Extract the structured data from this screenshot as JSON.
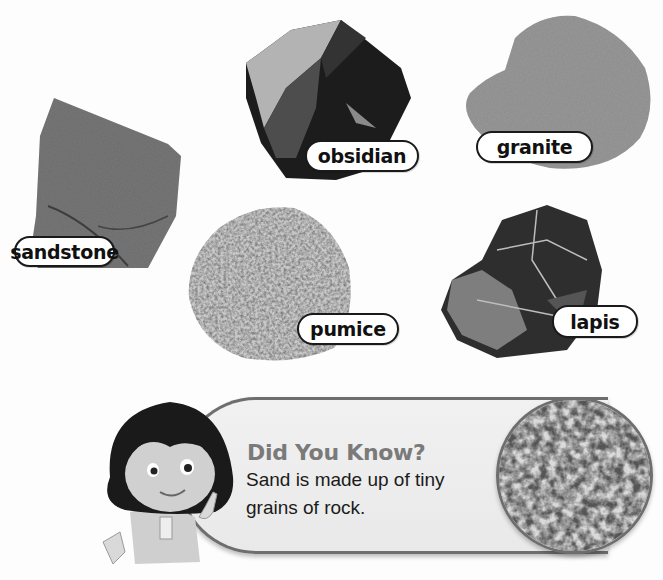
{
  "rocks": [
    {
      "id": "sandstone",
      "label": "sandstone"
    },
    {
      "id": "obsidian",
      "label": "obsidian"
    },
    {
      "id": "granite",
      "label": "granite"
    },
    {
      "id": "pumice",
      "label": "pumice"
    },
    {
      "id": "lapis",
      "label": "lapis"
    }
  ],
  "did_you_know": {
    "title": "Did You Know?",
    "text": "Sand is made up of tiny grains of rock.",
    "image": "sand-grains-closeup",
    "character": "girl-pointing-finger"
  },
  "colors": {
    "title_gray": "#7a7a7a",
    "box_border": "#6e6e6e",
    "box_fill": "#eeeeee",
    "label_border": "#1a1a1a"
  }
}
